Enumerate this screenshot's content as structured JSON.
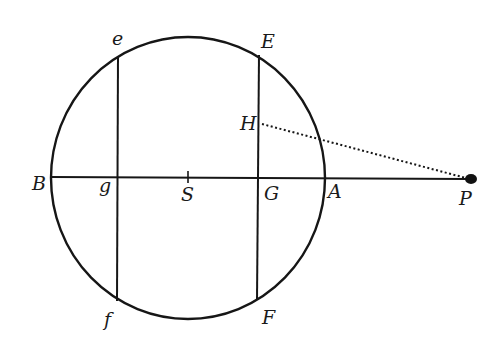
{
  "diagram": {
    "type": "geometric-figure",
    "colors": {
      "ink": "#161616",
      "background": "#ffffff"
    },
    "circle": {
      "center": "S",
      "cx": 188,
      "cy": 178,
      "rx": 137,
      "ry": 141
    },
    "points": {
      "B": {
        "label": "B",
        "x": 51,
        "y": 177
      },
      "g": {
        "label": "g",
        "x": 117,
        "y": 177
      },
      "S": {
        "label": "S",
        "x": 188,
        "y": 177
      },
      "G": {
        "label": "G",
        "x": 259,
        "y": 177
      },
      "A": {
        "label": "A",
        "x": 325,
        "y": 177
      },
      "P": {
        "label": "P",
        "x": 470,
        "y": 179
      },
      "e": {
        "label": "e",
        "x": 118,
        "y": 56
      },
      "E": {
        "label": "E",
        "x": 259,
        "y": 55
      },
      "H": {
        "label": "H",
        "x": 260,
        "y": 124
      },
      "f": {
        "label": "f",
        "x": 117,
        "y": 301
      },
      "F": {
        "label": "F",
        "x": 257,
        "y": 300
      }
    },
    "segments": [
      {
        "from": "B",
        "to": "P",
        "style": "solid"
      },
      {
        "from": "e",
        "to": "f",
        "style": "solid"
      },
      {
        "from": "E",
        "to": "F",
        "style": "solid"
      },
      {
        "from": "H",
        "to": "P",
        "style": "dotted"
      }
    ]
  }
}
